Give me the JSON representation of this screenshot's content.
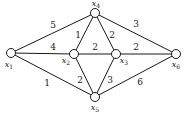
{
  "graph": {
    "nodes": [
      {
        "id": "x1",
        "label": "x",
        "sub": "1",
        "cx": 11,
        "cy": 53,
        "lx": 9,
        "ly": 65
      },
      {
        "id": "x2",
        "label": "x",
        "sub": "2",
        "cx": 74,
        "cy": 54,
        "lx": 66,
        "ly": 61
      },
      {
        "id": "x3",
        "label": "x",
        "sub": "3",
        "cx": 116,
        "cy": 54,
        "lx": 124,
        "ly": 61
      },
      {
        "id": "x4",
        "label": "x",
        "sub": "4",
        "cx": 95,
        "cy": 13,
        "lx": 96,
        "ly": 4
      },
      {
        "id": "x5",
        "label": "x",
        "sub": "5",
        "cx": 95,
        "cy": 97,
        "lx": 95,
        "ly": 108
      },
      {
        "id": "x6",
        "label": "x",
        "sub": "6",
        "cx": 176,
        "cy": 54,
        "lx": 176,
        "ly": 65
      }
    ],
    "edges": [
      {
        "from": "x1",
        "to": "x4",
        "weight": "5",
        "wx": 53,
        "wy": 25
      },
      {
        "from": "x1",
        "to": "x2",
        "weight": "4",
        "wx": 53,
        "wy": 47
      },
      {
        "from": "x1",
        "to": "x5",
        "weight": "1",
        "wx": 47,
        "wy": 83
      },
      {
        "from": "x2",
        "to": "x4",
        "weight": "1",
        "wx": 78,
        "wy": 35
      },
      {
        "from": "x2",
        "to": "x3",
        "weight": "2",
        "wx": 95,
        "wy": 47
      },
      {
        "from": "x2",
        "to": "x5",
        "weight": "2",
        "wx": 80,
        "wy": 80
      },
      {
        "from": "x3",
        "to": "x4",
        "weight": "2",
        "wx": 112,
        "wy": 35
      },
      {
        "from": "x3",
        "to": "x5",
        "weight": "3",
        "wx": 110,
        "wy": 80
      },
      {
        "from": "x4",
        "to": "x6",
        "weight": "3",
        "wx": 136,
        "wy": 24
      },
      {
        "from": "x3",
        "to": "x6",
        "weight": "2",
        "wx": 136,
        "wy": 47
      },
      {
        "from": "x5",
        "to": "x6",
        "weight": "6",
        "wx": 140,
        "wy": 82
      }
    ]
  }
}
